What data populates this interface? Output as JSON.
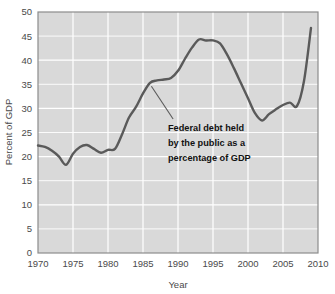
{
  "chart_data": {
    "type": "line",
    "title": "",
    "xlabel": "Year",
    "ylabel": "Percent of GDP",
    "xlim": [
      1970,
      2010
    ],
    "ylim": [
      0,
      50
    ],
    "grid": true,
    "legend": "none",
    "series_name": "Federal debt held by the public as a percentage of GDP",
    "xticks": [
      "1970",
      "1975",
      "1980",
      "1985",
      "1990",
      "1995",
      "2000",
      "2005",
      "2010"
    ],
    "yticks": [
      "0",
      "5",
      "10",
      "15",
      "20",
      "25",
      "30",
      "35",
      "40",
      "45",
      "50"
    ],
    "x": [
      1970,
      1971,
      1972,
      1973,
      1974,
      1975,
      1976,
      1977,
      1978,
      1979,
      1980,
      1981,
      1982,
      1983,
      1984,
      1985,
      1986,
      1987,
      1988,
      1989,
      1990,
      1991,
      1992,
      1993,
      1994,
      1995,
      1996,
      1997,
      1998,
      1999,
      2000,
      2001,
      2002,
      2003,
      2004,
      2005,
      2006,
      2007,
      2008,
      2009
    ],
    "y": [
      22.3,
      22.0,
      21.2,
      20.0,
      18.3,
      20.6,
      22.0,
      22.4,
      21.6,
      20.8,
      21.4,
      21.6,
      24.6,
      28.1,
      30.3,
      33.1,
      35.3,
      35.8,
      36.0,
      36.3,
      37.8,
      40.3,
      42.6,
      44.3,
      44.1,
      44.1,
      43.5,
      41.2,
      38.3,
      35.2,
      32.1,
      29.0,
      27.5,
      28.8,
      29.8,
      30.7,
      31.2,
      30.5,
      35.7,
      46.7
    ],
    "annotation": {
      "lines": [
        "Federal debt held",
        "by the public as a",
        "percentage of GDP"
      ],
      "text": "Federal debt held by the public as a percentage of GDP",
      "leader_from_year": 1986.2,
      "leader_from_value": 34.6,
      "leader_to_year": 1989.3,
      "leader_to_value": 27.8
    },
    "colors": {
      "line": "#5a5a5a",
      "plot_background": "#d9d9d9",
      "gridline": "#ffffff",
      "plot_border": "#8c8c8c",
      "text": "#4a4a4a",
      "annotation_text": "#111111",
      "page_background": "#ffffff"
    }
  }
}
